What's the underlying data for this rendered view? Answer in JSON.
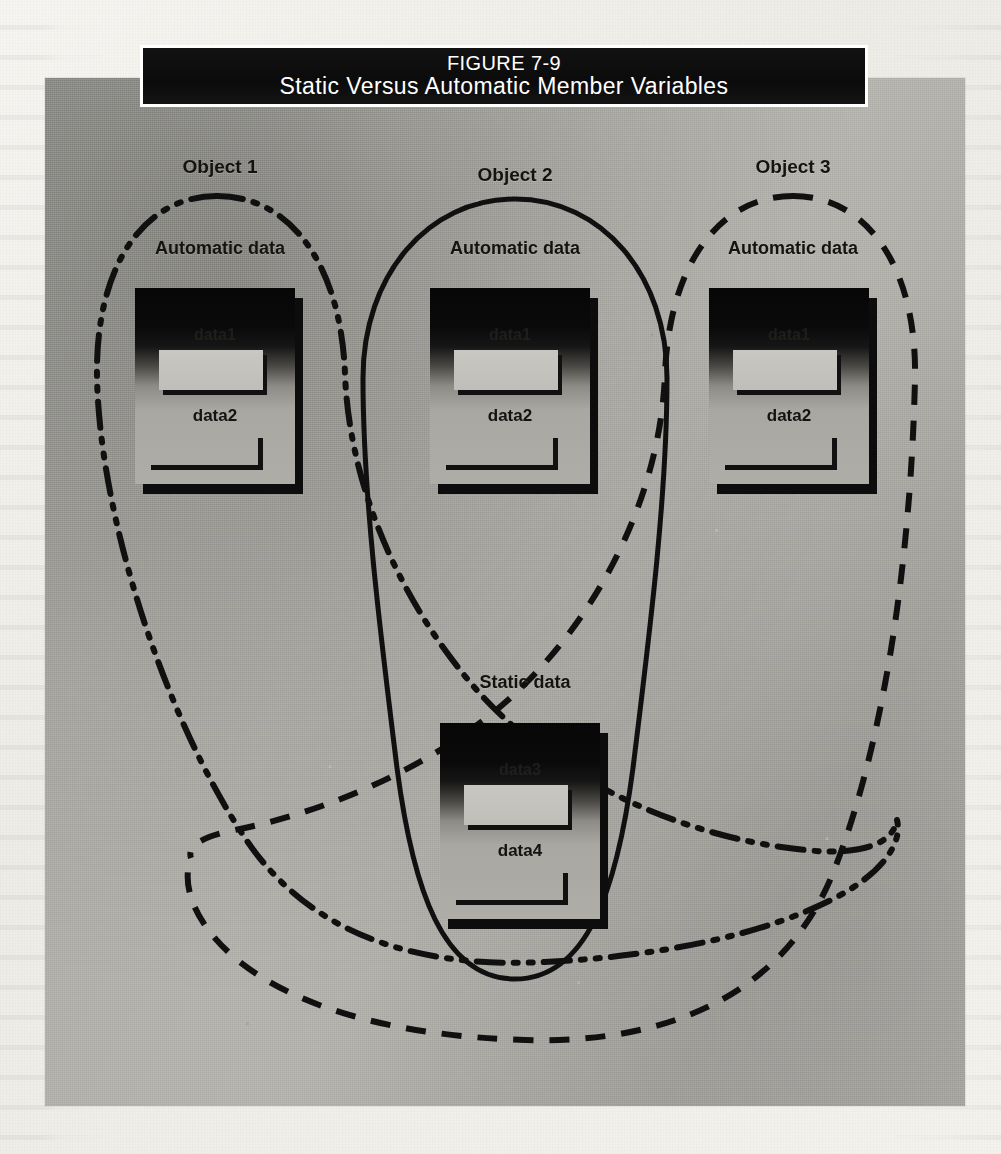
{
  "figure": {
    "number_label": "FIGURE 7-9",
    "title": "Static Versus Automatic Member Variables"
  },
  "objects": [
    {
      "id": "object-1",
      "label": "Object 1",
      "group_label": "Automatic data",
      "boundary_style": "dash-dot-dot",
      "block": {
        "field1": "data1",
        "field2": "data2"
      }
    },
    {
      "id": "object-2",
      "label": "Object 2",
      "group_label": "Automatic data",
      "boundary_style": "solid",
      "block": {
        "field1": "data1",
        "field2": "data2"
      }
    },
    {
      "id": "object-3",
      "label": "Object 3",
      "group_label": "Automatic data",
      "boundary_style": "dashed",
      "block": {
        "field1": "data1",
        "field2": "data2"
      }
    }
  ],
  "static_region": {
    "label": "Static data",
    "block": {
      "field1": "data3",
      "field2": "data4"
    }
  },
  "colors": {
    "banner_background": "#0b0b0b",
    "banner_text": "#ffffff",
    "plate_background": "#b0afaa",
    "ink": "#111111",
    "page_background": "#f2f1ec"
  }
}
